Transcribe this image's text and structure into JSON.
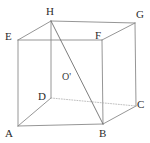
{
  "figure": {
    "name": "cube-diagram",
    "width": 150,
    "height": 143,
    "background_color": "#ffffff",
    "edge_color": "#8a8a8a",
    "hidden_edge_color": "#b0b0b0",
    "diagonal_color": "#6e6e6e",
    "label_color": "#2b2b2b"
  },
  "vertices": [
    {
      "id": "A",
      "label": "A",
      "x": 18,
      "y": 126,
      "label_x": 5,
      "label_y": 128
    },
    {
      "id": "B",
      "label": "B",
      "x": 103,
      "y": 124,
      "label_x": 99,
      "label_y": 128
    },
    {
      "id": "C",
      "label": "C",
      "x": 136,
      "y": 106,
      "label_x": 137,
      "label_y": 99
    },
    {
      "id": "D",
      "label": "D",
      "x": 51,
      "y": 98,
      "label_x": 38,
      "label_y": 91
    },
    {
      "id": "E",
      "label": "E",
      "x": 18,
      "y": 40,
      "label_x": 5,
      "label_y": 31
    },
    {
      "id": "F",
      "label": "F",
      "x": 102,
      "y": 40,
      "label_x": 95,
      "label_y": 30
    },
    {
      "id": "G",
      "label": "G",
      "x": 135,
      "y": 23,
      "label_x": 136,
      "label_y": 9
    },
    {
      "id": "H",
      "label": "H",
      "x": 51,
      "y": 21,
      "label_x": 46,
      "label_y": 6
    }
  ],
  "interior_points": [
    {
      "id": "O-prime",
      "label": "O'",
      "label_x": 62,
      "label_y": 72
    }
  ],
  "edges": [
    {
      "id": "AB",
      "from": "A",
      "to": "B",
      "style": "solid"
    },
    {
      "id": "BF",
      "from": "B",
      "to": "F",
      "style": "solid"
    },
    {
      "id": "FE",
      "from": "F",
      "to": "E",
      "style": "solid"
    },
    {
      "id": "EA",
      "from": "E",
      "to": "A",
      "style": "solid"
    },
    {
      "id": "AD",
      "from": "A",
      "to": "D",
      "style": "solid"
    },
    {
      "id": "DH",
      "from": "D",
      "to": "H",
      "style": "solid"
    },
    {
      "id": "HE",
      "from": "H",
      "to": "E",
      "style": "solid"
    },
    {
      "id": "HG",
      "from": "H",
      "to": "G",
      "style": "solid"
    },
    {
      "id": "FG",
      "from": "F",
      "to": "G",
      "style": "solid"
    },
    {
      "id": "GC",
      "from": "G",
      "to": "C",
      "style": "solid"
    },
    {
      "id": "BC",
      "from": "B",
      "to": "C",
      "style": "solid"
    },
    {
      "id": "DC",
      "from": "D",
      "to": "C",
      "style": "dotted"
    }
  ],
  "diagonals": [
    {
      "id": "HB",
      "from": "H",
      "to": "B",
      "style": "solid",
      "passes_through": "O-prime"
    }
  ]
}
